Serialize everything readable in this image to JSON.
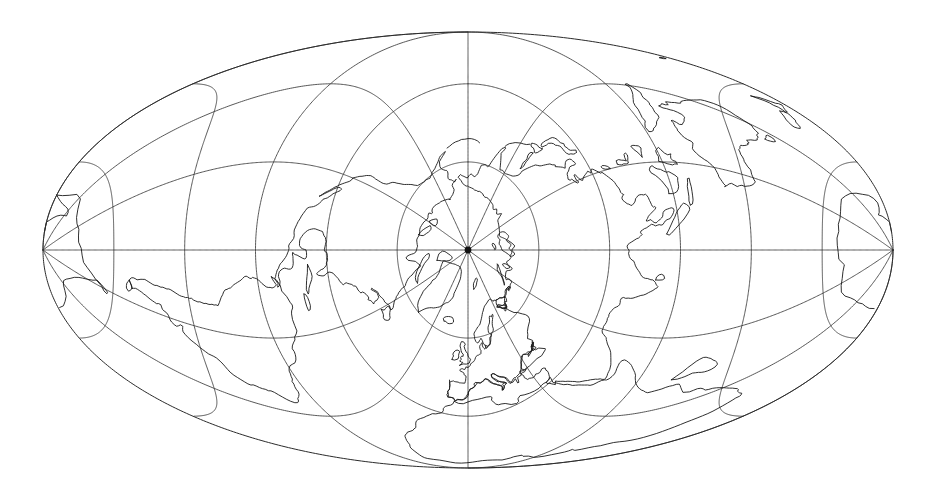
{
  "figure": {
    "title": "",
    "caption": "",
    "background_color": "#ffffff",
    "width": 935,
    "height": 494
  },
  "chart_data": {
    "type": "map",
    "title": "",
    "subtitle": "",
    "xlabel": "",
    "ylabel": "",
    "projection": {
      "name": "Transverse Mollweide",
      "family": "pseudocylindrical equal-area",
      "aspect": "transverse / polar-centred",
      "center_latitude": 90,
      "center_longitude": 0,
      "center_label": "North Pole at map centre",
      "rotation_degrees": 0
    },
    "graticule": {
      "meridian_interval_degrees": 30,
      "parallel_interval_degrees": 30,
      "meridian_count": 12,
      "meridian_longitudes": [
        -180,
        -150,
        -120,
        -90,
        -60,
        -30,
        0,
        30,
        60,
        90,
        120,
        150
      ],
      "parallel_latitudes": [
        -60,
        -30,
        0,
        30,
        60
      ],
      "grid_on": true,
      "line_color": "#3a3a3a",
      "boundary_color": "#2b2b2b",
      "coastline_color": "#181818"
    },
    "ellipse": {
      "center_x": 468,
      "center_y": 250,
      "semi_major_axis_x": 425,
      "semi_minor_axis_y": 218,
      "left_vertex_x": 43,
      "right_vertex_x": 893,
      "top_vertex_y": 32,
      "bottom_vertex_y": 468
    },
    "features": [
      "coastlines",
      "graticule",
      "projection boundary ellipse",
      "pole point marker"
    ],
    "legend": {
      "entries": [],
      "position": "none"
    },
    "annotations": [],
    "tick_labels": [],
    "axis_ranges": {
      "longitude": [
        -180,
        180
      ],
      "latitude": [
        -90,
        90
      ]
    },
    "landmasses_visible": [
      "Eurasia",
      "Africa",
      "North America",
      "South America",
      "Australia",
      "Antarctica",
      "Greenland",
      "Iceland",
      "Japan",
      "British Isles",
      "Madagascar",
      "New Zealand",
      "Indonesia",
      "Philippines",
      "Sri Lanka",
      "New Guinea",
      "Borneo"
    ]
  }
}
